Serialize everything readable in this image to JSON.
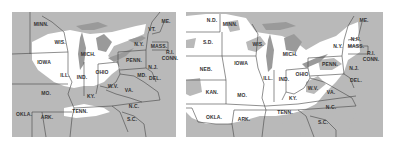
{
  "maps": [
    {
      "id": "left",
      "description": "Eastern US map with snow cover (white) over Great Lakes states; gray elsewhere",
      "colors": {
        "snow": "#ffffff",
        "no_snow": "#b9b9b9",
        "lakes": "#9a9a9a",
        "border": "#444444"
      },
      "labels": [
        {
          "text": "MINN.",
          "x": 29,
          "y": 12
        },
        {
          "text": "WIS.",
          "x": 48,
          "y": 30
        },
        {
          "text": "MICH.",
          "x": 76,
          "y": 42
        },
        {
          "text": "N.Y.",
          "x": 127,
          "y": 32
        },
        {
          "text": "VT.",
          "x": 140,
          "y": 17
        },
        {
          "text": "ME.",
          "x": 154,
          "y": 9
        },
        {
          "text": "MASS.",
          "x": 147,
          "y": 34
        },
        {
          "text": "R.I.",
          "x": 158,
          "y": 40
        },
        {
          "text": "CONN.",
          "x": 158,
          "y": 46
        },
        {
          "text": "IOWA",
          "x": 32,
          "y": 50
        },
        {
          "text": "PENN.",
          "x": 122,
          "y": 48
        },
        {
          "text": "N.J.",
          "x": 141,
          "y": 55
        },
        {
          "text": "ILL.",
          "x": 53,
          "y": 63
        },
        {
          "text": "IND.",
          "x": 70,
          "y": 65
        },
        {
          "text": "OHIO",
          "x": 90,
          "y": 60
        },
        {
          "text": "MD.",
          "x": 130,
          "y": 63
        },
        {
          "text": "DEL.",
          "x": 143,
          "y": 66
        },
        {
          "text": "W.V.",
          "x": 101,
          "y": 74
        },
        {
          "text": "VA.",
          "x": 117,
          "y": 78
        },
        {
          "text": "MO.",
          "x": 34,
          "y": 81
        },
        {
          "text": "KY.",
          "x": 79,
          "y": 84
        },
        {
          "text": "N.C.",
          "x": 122,
          "y": 94
        },
        {
          "text": "TENN.",
          "x": 68,
          "y": 99
        },
        {
          "text": "OKLA.",
          "x": 12,
          "y": 102
        },
        {
          "text": "ARK.",
          "x": 35,
          "y": 105
        },
        {
          "text": "S.C.",
          "x": 120,
          "y": 107
        }
      ]
    },
    {
      "id": "right",
      "description": "Eastern and central US map with broader snow cover (white) across most states; gray in Appalachians and southeast",
      "colors": {
        "snow": "#ffffff",
        "no_snow": "#b9b9b9",
        "lakes": "#9a9a9a",
        "border": "#444444"
      },
      "labels": [
        {
          "text": "N.D.",
          "x": 26,
          "y": 8
        },
        {
          "text": "MINN.",
          "x": 44,
          "y": 12
        },
        {
          "text": "S.D.",
          "x": 22,
          "y": 30
        },
        {
          "text": "WIS.",
          "x": 72,
          "y": 32
        },
        {
          "text": "MICH.",
          "x": 104,
          "y": 42
        },
        {
          "text": "N.Y.",
          "x": 152,
          "y": 34
        },
        {
          "text": "ME.",
          "x": 178,
          "y": 8
        },
        {
          "text": "N.H.",
          "x": 170,
          "y": 27
        },
        {
          "text": "MASS.",
          "x": 170,
          "y": 34
        },
        {
          "text": "R.I.",
          "x": 185,
          "y": 41
        },
        {
          "text": "CONN.",
          "x": 185,
          "y": 47
        },
        {
          "text": "IOWA",
          "x": 55,
          "y": 51
        },
        {
          "text": "NEB.",
          "x": 20,
          "y": 57
        },
        {
          "text": "PENN.",
          "x": 144,
          "y": 52
        },
        {
          "text": "N.J.",
          "x": 168,
          "y": 56
        },
        {
          "text": "ILL.",
          "x": 82,
          "y": 66
        },
        {
          "text": "IND.",
          "x": 98,
          "y": 67
        },
        {
          "text": "OHIO",
          "x": 116,
          "y": 62
        },
        {
          "text": "DEL.",
          "x": 170,
          "y": 68
        },
        {
          "text": "W.V.",
          "x": 127,
          "y": 76
        },
        {
          "text": "VA.",
          "x": 145,
          "y": 80
        },
        {
          "text": "KAN.",
          "x": 26,
          "y": 80
        },
        {
          "text": "MO.",
          "x": 56,
          "y": 83
        },
        {
          "text": "KY.",
          "x": 107,
          "y": 86
        },
        {
          "text": "N.C.",
          "x": 145,
          "y": 95
        },
        {
          "text": "TENN.",
          "x": 99,
          "y": 100
        },
        {
          "text": "OKLA.",
          "x": 28,
          "y": 105
        },
        {
          "text": "ARK.",
          "x": 58,
          "y": 107
        },
        {
          "text": "S.C.",
          "x": 137,
          "y": 110
        }
      ]
    }
  ]
}
